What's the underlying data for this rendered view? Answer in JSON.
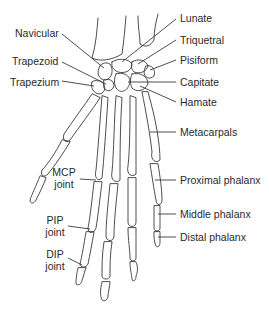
{
  "diagram": {
    "labels_left": {
      "navicular": "Navicular",
      "trapezoid": "Trapezoid",
      "trapezium": "Trapezium",
      "mcp_joint_1": "MCP",
      "mcp_joint_2": "joint",
      "pip_joint_1": "PIP",
      "pip_joint_2": "joint",
      "dip_joint_1": "DIP",
      "dip_joint_2": "joint"
    },
    "labels_right": {
      "lunate": "Lunate",
      "triquetral": "Triquetral",
      "pisiform": "Pisiform",
      "capitate": "Capitate",
      "hamate": "Hamate",
      "metacarpals": "Metacarpals",
      "proximal_phalanx": "Proximal phalanx",
      "middle_phalanx": "Middle phalanx",
      "distal_phalanx": "Distal phalanx"
    },
    "colors": {
      "line": "#3a3a3a",
      "text": "#2a2a2a",
      "background": "#ffffff"
    }
  }
}
